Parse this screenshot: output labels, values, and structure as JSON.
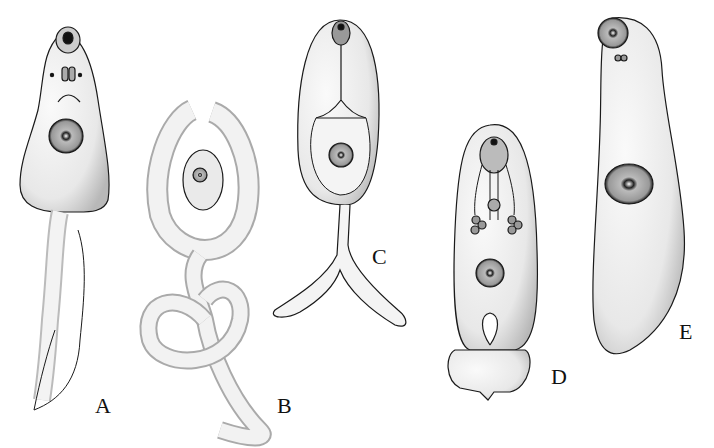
{
  "figure": {
    "panels": [
      {
        "id": "A",
        "label": "A",
        "label_x": 103,
        "label_y": 370
      },
      {
        "id": "B",
        "label": "B",
        "label_x": 278,
        "label_y": 373
      },
      {
        "id": "C",
        "label": "C",
        "label_x": 372,
        "label_y": 243
      },
      {
        "id": "D",
        "label": "D",
        "label_x": 553,
        "label_y": 364
      },
      {
        "id": "E",
        "label": "E",
        "label_x": 679,
        "label_y": 321
      }
    ]
  },
  "colors": {
    "ink": "#1a1a1a",
    "paper": "#ffffff",
    "stipple": "#d8d8d8"
  }
}
